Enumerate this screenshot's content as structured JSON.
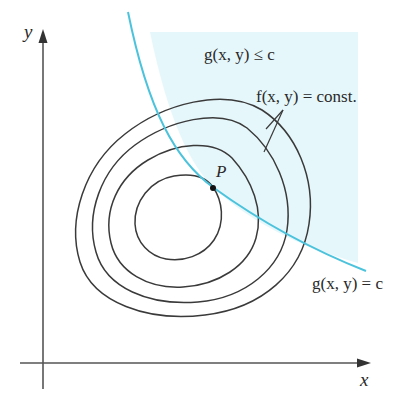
{
  "figure": {
    "colors": {
      "background": "#ffffff",
      "region_fill": "#e6f7fb",
      "constraint_curve": "#4cc3dc",
      "contours": "#3a3a3a",
      "axes": "#555555",
      "text": "#2a2a2a"
    }
  },
  "axes": {
    "x_label": "x",
    "y_label": "y"
  },
  "labels": {
    "region": "g(x, y) ≤ c",
    "level_curves": "f(x, y) = const.",
    "point": "P",
    "constraint": "g(x, y) = c"
  },
  "elements": {
    "contour_count": 4,
    "point_marker": "P"
  }
}
